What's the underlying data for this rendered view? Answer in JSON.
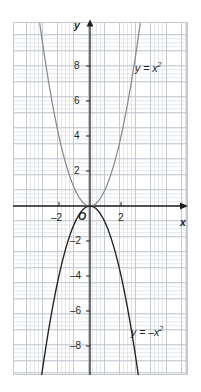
{
  "chart_data": {
    "type": "line",
    "title": "",
    "xlabel": "x",
    "ylabel": "y",
    "xlim": [
      -4.9,
      6.3
    ],
    "ylim": [
      -10.1,
      10.6
    ],
    "grid": true,
    "grid_minor_step": 0.25,
    "grid_major_step": 1,
    "legend_position": "inline-annotations",
    "xticks": [
      -2,
      2
    ],
    "xtick_labels": [
      "–2",
      "2"
    ],
    "yticks": [
      -8,
      -6,
      -4,
      -2,
      2,
      4,
      6,
      8
    ],
    "ytick_labels": [
      "–8",
      "–6",
      "–4",
      "–2",
      "2",
      "4",
      "6",
      "8"
    ],
    "origin_label": "O",
    "series": [
      {
        "name": "y = x²",
        "label_text": "y = x",
        "label_exponent": "2",
        "equation": "y = x^2",
        "color": "#8a8a8a",
        "x": [
          -3.3,
          -3.0,
          -2.7,
          -2.4,
          -2.1,
          -1.8,
          -1.5,
          -1.2,
          -0.9,
          -0.6,
          -0.3,
          0,
          0.3,
          0.6,
          0.9,
          1.2,
          1.5,
          1.8,
          2.1,
          2.4,
          2.7,
          3.0,
          3.3
        ],
        "y": [
          10.89,
          9.0,
          7.29,
          5.76,
          4.41,
          3.24,
          2.25,
          1.44,
          0.81,
          0.36,
          0.09,
          0,
          0.09,
          0.36,
          0.81,
          1.44,
          2.25,
          3.24,
          4.41,
          5.76,
          7.29,
          9.0,
          10.89
        ]
      },
      {
        "name": "y = –x²",
        "label_text": "y = –x",
        "label_exponent": "2",
        "equation": "y = -x^2",
        "color": "#231f20",
        "x": [
          -3.2,
          -3.0,
          -2.7,
          -2.4,
          -2.1,
          -1.8,
          -1.5,
          -1.2,
          -0.9,
          -0.6,
          -0.3,
          0,
          0.3,
          0.6,
          0.9,
          1.2,
          1.5,
          1.8,
          2.1,
          2.4,
          2.7,
          3.0,
          3.2
        ],
        "y": [
          -10.24,
          -9.0,
          -7.29,
          -5.76,
          -4.41,
          -3.24,
          -2.25,
          -1.44,
          -0.81,
          -0.36,
          -0.09,
          0,
          -0.09,
          -0.36,
          -0.81,
          -1.44,
          -2.25,
          -3.24,
          -4.41,
          -5.76,
          -7.29,
          -9.0,
          -10.24
        ]
      }
    ],
    "annotations": [
      {
        "text": "y = x²",
        "x": 4.0,
        "y": 8.6
      },
      {
        "text": "y = –x²",
        "x": 3.6,
        "y": -8.2
      }
    ],
    "colors": {
      "axis": "#231f20",
      "grid_minor": "#e3e6ea",
      "grid_major": "#c4c9d0",
      "curve_positive": "#8a8a8a",
      "curve_negative": "#231f20",
      "text": "#231f20",
      "background": "#ffffff"
    }
  },
  "axes": {
    "x_name": "x",
    "y_name": "y",
    "origin": "O"
  },
  "ticks": {
    "x": [
      {
        "label": "–2"
      },
      {
        "label": "2"
      }
    ],
    "y": [
      {
        "label": "8"
      },
      {
        "label": "6"
      },
      {
        "label": "4"
      },
      {
        "label": "2"
      },
      {
        "label": "–2"
      },
      {
        "label": "–4"
      },
      {
        "label": "–6"
      },
      {
        "label": "–8"
      }
    ]
  },
  "curve_labels": {
    "positive_base": "y = x",
    "positive_exp": "2",
    "negative_base": "y = –x",
    "negative_exp": "2"
  }
}
